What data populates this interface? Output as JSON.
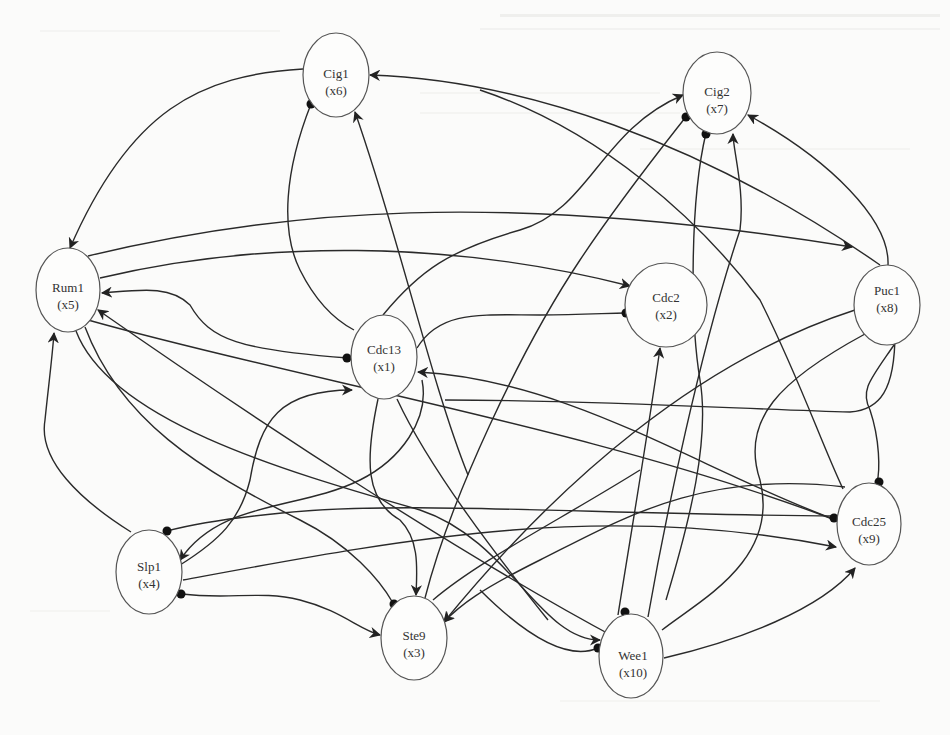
{
  "diagram": {
    "type": "gene-regulatory-network",
    "nodes": [
      {
        "id": "x1",
        "name": "Cdc13",
        "var": "(x1)",
        "cx": 384,
        "cy": 357,
        "rx": 33,
        "ry": 42
      },
      {
        "id": "x2",
        "name": "Cdc2",
        "var": "(x2)",
        "cx": 666,
        "cy": 305,
        "rx": 41,
        "ry": 42
      },
      {
        "id": "x3",
        "name": "Ste9",
        "var": "(x3)",
        "cx": 414,
        "cy": 638,
        "rx": 33,
        "ry": 42
      },
      {
        "id": "x4",
        "name": "Slp1",
        "var": "(x4)",
        "cx": 149,
        "cy": 572,
        "rx": 33,
        "ry": 42
      },
      {
        "id": "x5",
        "name": "Rum1",
        "var": "(x5)",
        "cx": 68,
        "cy": 290,
        "rx": 32,
        "ry": 42
      },
      {
        "id": "x6",
        "name": "Cig1",
        "var": "(x6)",
        "cx": 336,
        "cy": 75,
        "rx": 33,
        "ry": 42
      },
      {
        "id": "x7",
        "name": "Cig2",
        "var": "(x7)",
        "cx": 717,
        "cy": 93,
        "rx": 34,
        "ry": 41
      },
      {
        "id": "x8",
        "name": "Puc1",
        "var": "(x8)",
        "cx": 887,
        "cy": 305,
        "rx": 33,
        "ry": 40
      },
      {
        "id": "x9",
        "name": "Cdc25",
        "var": "(x9)",
        "cx": 869,
        "cy": 524,
        "rx": 32,
        "ry": 41
      },
      {
        "id": "x10",
        "name": "Wee1",
        "var": "(x10)",
        "cx": 631,
        "cy": 656,
        "rx": 32,
        "ry": 42
      }
    ],
    "legend": {
      "arrow": "activation",
      "dot": "inhibition"
    },
    "edges": [
      {
        "from": "Cig1",
        "to": "Rum1",
        "type": "activation"
      },
      {
        "from": "Puc1",
        "to": "Cig1",
        "type": "activation"
      },
      {
        "from": "Cdc13",
        "to": "Cig1",
        "type": "activation"
      },
      {
        "from": "Cig1",
        "to": "Cdc13",
        "type": "inhibition"
      },
      {
        "from": "Rum1",
        "to": "Puc1",
        "type": "activation"
      },
      {
        "from": "Rum1",
        "to": "Cdc2",
        "type": "activation"
      },
      {
        "from": "Rum1",
        "to": "Cdc13",
        "type": "inhibition"
      },
      {
        "from": "Slp1",
        "to": "Rum1",
        "type": "activation"
      },
      {
        "from": "Ste9",
        "to": "Rum1",
        "type": "activation"
      },
      {
        "from": "Cdc13",
        "to": "Cig2",
        "type": "activation"
      },
      {
        "from": "Cdc13",
        "to": "Cdc2",
        "type": "inhibition"
      },
      {
        "from": "Puc1",
        "to": "Cig2",
        "type": "activation"
      },
      {
        "from": "Wee1",
        "to": "Cig2",
        "type": "activation"
      },
      {
        "from": "Cdc25",
        "to": "Cdc13",
        "type": "activation"
      },
      {
        "from": "Wee1",
        "to": "Cdc2",
        "type": "activation"
      },
      {
        "from": "Slp1",
        "to": "Cdc13",
        "type": "activation"
      },
      {
        "from": "Cdc13",
        "to": "Slp1",
        "type": "activation"
      },
      {
        "from": "Cdc13",
        "to": "Ste9",
        "type": "activation"
      },
      {
        "from": "Slp1",
        "to": "Ste9",
        "type": "inhibition"
      },
      {
        "from": "Slp1",
        "to": "Cdc25",
        "type": "activation"
      },
      {
        "from": "Cdc25",
        "to": "Slp1",
        "type": "inhibition"
      },
      {
        "from": "Puc1",
        "to": "Cdc25",
        "type": "inhibition"
      },
      {
        "from": "Puc1",
        "to": "Wee1",
        "type": "inhibition"
      },
      {
        "from": "Wee1",
        "to": "Cdc25",
        "type": "activation"
      },
      {
        "from": "Rum1",
        "to": "Wee1",
        "type": "activation"
      },
      {
        "from": "Ste9",
        "to": "Cig2",
        "type": "inhibition"
      },
      {
        "from": "Cdc25",
        "to": "Ste9",
        "type": "activation"
      }
    ]
  }
}
